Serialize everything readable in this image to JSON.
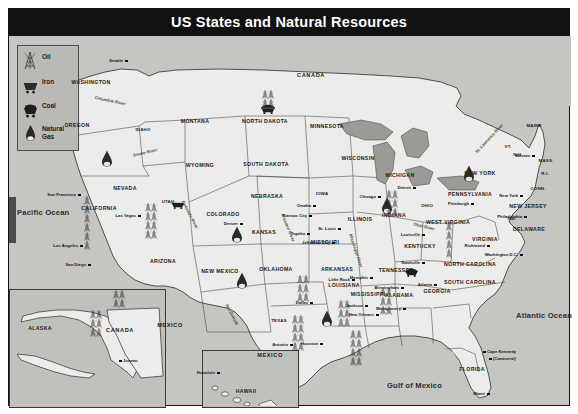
{
  "title": "US States and Natural Resources",
  "legend": {
    "items": [
      {
        "icon": "oil-derrick-icon",
        "label": "Oil"
      },
      {
        "icon": "iron-cart-icon",
        "label": "Iron"
      },
      {
        "icon": "coal-cart-icon",
        "label": "Coal"
      },
      {
        "icon": "natural-gas-drop-icon",
        "label": "Natural Gas"
      }
    ]
  },
  "oceans": [
    {
      "name": "Pacific Ocean",
      "x": 17,
      "y": 208
    },
    {
      "name": "Atlantic Ocean",
      "x": 516,
      "y": 311
    },
    {
      "name": "Gulf of Mexico",
      "x": 387,
      "y": 381
    }
  ],
  "countries": [
    {
      "name": "CANADA",
      "x": 311,
      "y": 72
    },
    {
      "name": "CANADA",
      "x": 120,
      "y": 327
    },
    {
      "name": "MEXICO",
      "x": 170,
      "y": 322
    },
    {
      "name": "MEXICO",
      "x": 270,
      "y": 352
    }
  ],
  "states": [
    {
      "name": "WASHINGTON",
      "x": 91,
      "y": 79
    },
    {
      "name": "OREGON",
      "x": 77,
      "y": 122
    },
    {
      "name": "IDAHO",
      "x": 143,
      "y": 127
    },
    {
      "name": "MONTANA",
      "x": 195,
      "y": 118
    },
    {
      "name": "NORTH DAKOTA",
      "x": 265,
      "y": 118
    },
    {
      "name": "MINNESOTA",
      "x": 327,
      "y": 123
    },
    {
      "name": "WYOMING",
      "x": 200,
      "y": 162
    },
    {
      "name": "SOUTH DAKOTA",
      "x": 266,
      "y": 161
    },
    {
      "name": "WISCONSIN",
      "x": 358,
      "y": 155
    },
    {
      "name": "MICHIGAN",
      "x": 400,
      "y": 172
    },
    {
      "name": "NEVADA",
      "x": 125,
      "y": 185
    },
    {
      "name": "UTAH",
      "x": 168,
      "y": 199
    },
    {
      "name": "NEBRASKA",
      "x": 267,
      "y": 193
    },
    {
      "name": "IOWA",
      "x": 322,
      "y": 191
    },
    {
      "name": "ILLINOIS",
      "x": 360,
      "y": 216
    },
    {
      "name": "INDIANA",
      "x": 394,
      "y": 212
    },
    {
      "name": "OHIO",
      "x": 427,
      "y": 203
    },
    {
      "name": "PENNSYLVANIA",
      "x": 470,
      "y": 191
    },
    {
      "name": "NEW YORK",
      "x": 480,
      "y": 170
    },
    {
      "name": "MAINE",
      "x": 534,
      "y": 123
    },
    {
      "name": "VT.",
      "x": 508,
      "y": 144
    },
    {
      "name": "N.H.",
      "x": 518,
      "y": 152
    },
    {
      "name": "MASS.",
      "x": 546,
      "y": 158
    },
    {
      "name": "R.I.",
      "x": 545,
      "y": 171
    },
    {
      "name": "CONN.",
      "x": 538,
      "y": 186
    },
    {
      "name": "NEW JERSEY",
      "x": 528,
      "y": 203
    },
    {
      "name": "DELAWARE",
      "x": 529,
      "y": 226
    },
    {
      "name": "MD.",
      "x": 512,
      "y": 216
    },
    {
      "name": "WEST VIRGINIA",
      "x": 448,
      "y": 219
    },
    {
      "name": "VIRGINIA",
      "x": 485,
      "y": 236
    },
    {
      "name": "CALIFORNIA",
      "x": 99,
      "y": 205
    },
    {
      "name": "COLORADO",
      "x": 223,
      "y": 211
    },
    {
      "name": "KANSAS",
      "x": 264,
      "y": 229
    },
    {
      "name": "MISSOURI",
      "x": 325,
      "y": 239
    },
    {
      "name": "KENTUCKY",
      "x": 420,
      "y": 243
    },
    {
      "name": "ARIZONA",
      "x": 163,
      "y": 258
    },
    {
      "name": "NEW MEXICO",
      "x": 220,
      "y": 268
    },
    {
      "name": "OKLAHOMA",
      "x": 276,
      "y": 266
    },
    {
      "name": "ARKANSAS",
      "x": 337,
      "y": 266
    },
    {
      "name": "TENNESSEE",
      "x": 396,
      "y": 267
    },
    {
      "name": "NORTH CAROLINA",
      "x": 470,
      "y": 261
    },
    {
      "name": "SOUTH CAROLINA",
      "x": 470,
      "y": 279
    },
    {
      "name": "MISSISSIPPI",
      "x": 368,
      "y": 291
    },
    {
      "name": "ALABAMA",
      "x": 399,
      "y": 292
    },
    {
      "name": "GEORGIA",
      "x": 437,
      "y": 288
    },
    {
      "name": "LOUISIANA",
      "x": 344,
      "y": 282
    },
    {
      "name": "TEXAS",
      "x": 279,
      "y": 318
    },
    {
      "name": "FLORIDA",
      "x": 472,
      "y": 366
    },
    {
      "name": "ALASKA",
      "x": 40,
      "y": 325
    },
    {
      "name": "HAWAII",
      "x": 246,
      "y": 388
    }
  ],
  "cities": [
    {
      "name": "Seattle",
      "x": 123,
      "y": 58,
      "anchor": "right"
    },
    {
      "name": "San Francisco",
      "x": 76,
      "y": 192,
      "anchor": "right"
    },
    {
      "name": "Las Vegas",
      "x": 136,
      "y": 213,
      "anchor": "right"
    },
    {
      "name": "Los Angeles",
      "x": 78,
      "y": 243,
      "anchor": "right"
    },
    {
      "name": "San Diego",
      "x": 86,
      "y": 262,
      "anchor": "right"
    },
    {
      "name": "Denver",
      "x": 238,
      "y": 221,
      "anchor": "right"
    },
    {
      "name": "Omaha",
      "x": 311,
      "y": 203,
      "anchor": "right"
    },
    {
      "name": "Kansas City",
      "x": 307,
      "y": 213,
      "anchor": "right"
    },
    {
      "name": "St. Louis",
      "x": 336,
      "y": 226,
      "anchor": "right"
    },
    {
      "name": "Topeka",
      "x": 305,
      "y": 231,
      "anchor": "right"
    },
    {
      "name": "Jefferson City",
      "x": 330,
      "y": 240,
      "anchor": "right"
    },
    {
      "name": "Chicago",
      "x": 376,
      "y": 194,
      "anchor": "right"
    },
    {
      "name": "Detroit",
      "x": 411,
      "y": 185,
      "anchor": "right"
    },
    {
      "name": "Pittsburgh",
      "x": 469,
      "y": 201,
      "anchor": "right"
    },
    {
      "name": "Boston",
      "x": 530,
      "y": 153,
      "anchor": "right"
    },
    {
      "name": "New York",
      "x": 518,
      "y": 193,
      "anchor": "right"
    },
    {
      "name": "Philadelphia",
      "x": 522,
      "y": 214,
      "anchor": "right"
    },
    {
      "name": "Washington D.C.",
      "x": 518,
      "y": 252,
      "anchor": "right"
    },
    {
      "name": "Richmond",
      "x": 485,
      "y": 243,
      "anchor": "right"
    },
    {
      "name": "Louisville",
      "x": 420,
      "y": 232,
      "anchor": "right"
    },
    {
      "name": "Nashville",
      "x": 420,
      "y": 260,
      "anchor": "right"
    },
    {
      "name": "Memphis",
      "x": 368,
      "y": 275,
      "anchor": "right"
    },
    {
      "name": "Little Rock",
      "x": 350,
      "y": 277,
      "anchor": "right"
    },
    {
      "name": "Birmingham",
      "x": 399,
      "y": 285,
      "anchor": "right"
    },
    {
      "name": "Montgomery",
      "x": 401,
      "y": 306,
      "anchor": "right"
    },
    {
      "name": "Atlanta",
      "x": 432,
      "y": 282,
      "anchor": "right"
    },
    {
      "name": "Jackson",
      "x": 363,
      "y": 303,
      "anchor": "right"
    },
    {
      "name": "New Orleans",
      "x": 374,
      "y": 312,
      "anchor": "right"
    },
    {
      "name": "Dallas",
      "x": 308,
      "y": 300,
      "anchor": "right"
    },
    {
      "name": "Houston",
      "x": 318,
      "y": 341,
      "anchor": "right"
    },
    {
      "name": "Antonio",
      "x": 288,
      "y": 342,
      "anchor": "right"
    },
    {
      "name": "Miami",
      "x": 485,
      "y": 391,
      "anchor": "right"
    },
    {
      "name": "Cape Kennedy",
      "x": 487,
      "y": 349,
      "anchor": "left"
    },
    {
      "name": "(Canaveral)",
      "x": 493,
      "y": 356,
      "anchor": "left"
    },
    {
      "name": "Juneau",
      "x": 123,
      "y": 358,
      "anchor": "left"
    },
    {
      "name": "Honolulu",
      "x": 215,
      "y": 370,
      "anchor": "right"
    }
  ],
  "rivers": [
    {
      "name": "Columbia River",
      "x": 110,
      "y": 98,
      "rot": 12
    },
    {
      "name": "Snake River",
      "x": 145,
      "y": 150,
      "rot": -13
    },
    {
      "name": "Colorado River",
      "x": 190,
      "y": 212,
      "rot": 62
    },
    {
      "name": "Rio Grande",
      "x": 232,
      "y": 312,
      "rot": 62
    },
    {
      "name": "Missouri River",
      "x": 288,
      "y": 225,
      "rot": 68
    },
    {
      "name": "Mississippi River",
      "x": 356,
      "y": 248,
      "rot": 72
    },
    {
      "name": "Ohio River",
      "x": 424,
      "y": 224,
      "rot": 14
    },
    {
      "name": "St. Lawrence River",
      "x": 489,
      "y": 136,
      "rot": -47
    }
  ],
  "resources": [
    {
      "type": "natural-gas-drop-icon",
      "x": 101,
      "y": 150,
      "w": 12,
      "h": 17
    },
    {
      "type": "natural-gas-drop-icon",
      "x": 231,
      "y": 226,
      "w": 12,
      "h": 17
    },
    {
      "type": "natural-gas-drop-icon",
      "x": 236,
      "y": 272,
      "w": 12,
      "h": 17
    },
    {
      "type": "natural-gas-drop-icon",
      "x": 321,
      "y": 310,
      "w": 12,
      "h": 17
    },
    {
      "type": "natural-gas-drop-icon",
      "x": 381,
      "y": 197,
      "w": 12,
      "h": 17
    },
    {
      "type": "natural-gas-drop-icon",
      "x": 463,
      "y": 165,
      "w": 12,
      "h": 17
    },
    {
      "type": "coal-cart-icon",
      "x": 260,
      "y": 100,
      "w": 16,
      "h": 11
    },
    {
      "type": "coal-cart-icon",
      "x": 404,
      "y": 263,
      "w": 15,
      "h": 10
    },
    {
      "type": "iron-cart-icon",
      "x": 170,
      "y": 195,
      "w": 16,
      "h": 10
    },
    {
      "type": "oil-field-icon",
      "x": 84,
      "y": 196,
      "w": 8,
      "h": 54
    },
    {
      "type": "oil-field-icon",
      "x": 145,
      "y": 203,
      "w": 10,
      "h": 34
    },
    {
      "type": "oil-field-icon",
      "x": 262,
      "y": 90,
      "w": 13,
      "h": 14
    },
    {
      "type": "oil-field-icon",
      "x": 297,
      "y": 275,
      "w": 11,
      "h": 24
    },
    {
      "type": "oil-field-icon",
      "x": 292,
      "y": 315,
      "w": 10,
      "h": 36
    },
    {
      "type": "oil-field-icon",
      "x": 338,
      "y": 300,
      "w": 10,
      "h": 30
    },
    {
      "type": "oil-field-icon",
      "x": 350,
      "y": 330,
      "w": 10,
      "h": 34
    },
    {
      "type": "oil-field-icon",
      "x": 380,
      "y": 288,
      "w": 9,
      "h": 26
    },
    {
      "type": "oil-field-icon",
      "x": 386,
      "y": 190,
      "w": 9,
      "h": 28
    },
    {
      "type": "oil-field-icon",
      "x": 446,
      "y": 222,
      "w": 8,
      "h": 34
    },
    {
      "type": "oil-field-icon",
      "x": 90,
      "y": 310,
      "w": 9,
      "h": 30
    },
    {
      "type": "oil-field-icon",
      "x": 113,
      "y": 290,
      "w": 9,
      "h": 18
    }
  ],
  "colors": {
    "title_bar": "#111111",
    "title_text": "#ffffff",
    "ocean": "#c5c5c2",
    "land": "#ececea",
    "lake": "#9a9a97",
    "border": "#2b2b2b",
    "legend_bg": "#b9b9b6"
  }
}
